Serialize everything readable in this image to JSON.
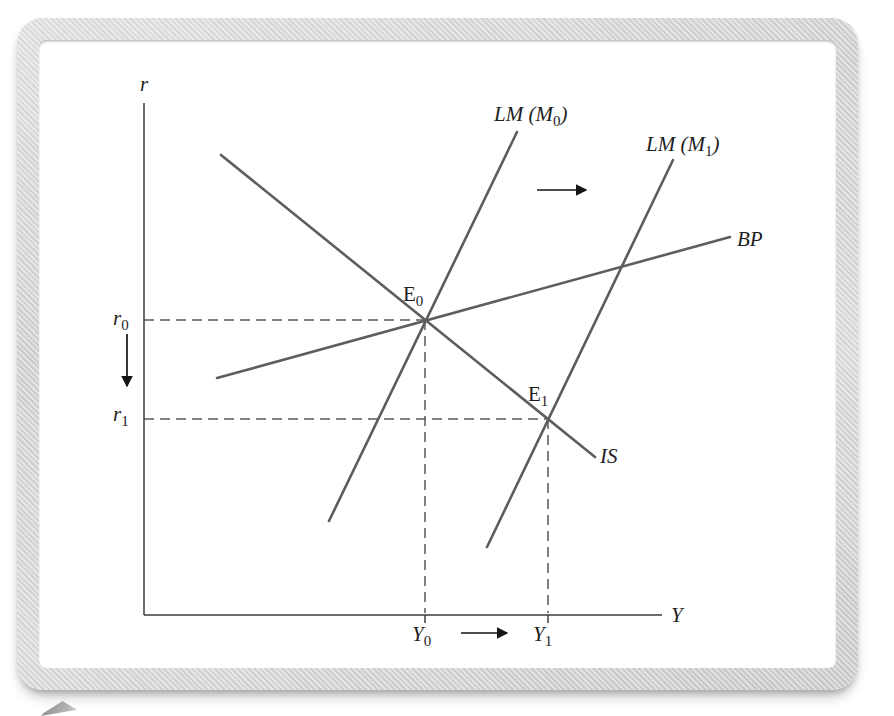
{
  "colors": {
    "curve": "#5d5d5d",
    "axis": "#3c3c3c",
    "guide": "#5a5a5a",
    "arrow": "#151515",
    "text": "#1e1e1e",
    "canvas": "#ffffff"
  },
  "diagram": {
    "axes": [
      {
        "name": "r-axis",
        "x1": 144,
        "y1": 103,
        "x2": 144,
        "y2": 615
      },
      {
        "name": "y-axis",
        "x1": 144,
        "y1": 615,
        "x2": 662,
        "y2": 615
      }
    ],
    "curves": [
      {
        "name": "is-curve",
        "x1": 221,
        "y1": 155,
        "x2": 595,
        "y2": 457
      },
      {
        "name": "lm-m0-curve",
        "x1": 329,
        "y1": 521,
        "x2": 517,
        "y2": 132
      },
      {
        "name": "lm-m1-curve",
        "x1": 487,
        "y1": 547,
        "x2": 673,
        "y2": 160
      },
      {
        "name": "bp-curve",
        "x1": 217,
        "y1": 378,
        "x2": 730,
        "y2": 237
      }
    ],
    "guides": [
      {
        "name": "r0-guide",
        "x1": 144,
        "y1": 320,
        "x2": 425,
        "y2": 320
      },
      {
        "name": "r1-guide",
        "x1": 144,
        "y1": 419,
        "x2": 548,
        "y2": 419
      },
      {
        "name": "y0-guide",
        "x1": 425,
        "y1": 320,
        "x2": 425,
        "y2": 613
      },
      {
        "name": "y1-guide",
        "x1": 548,
        "y1": 419,
        "x2": 548,
        "y2": 613
      }
    ],
    "ticks": [
      {
        "name": "y0-tick",
        "x1": 425,
        "y1": 615,
        "x2": 425,
        "y2": 623
      },
      {
        "name": "y1-tick",
        "x1": 548,
        "y1": 615,
        "x2": 548,
        "y2": 623
      }
    ],
    "arrows": [
      {
        "name": "lm-shift-arrow",
        "x1": 537,
        "y1": 190,
        "x2": 586,
        "y2": 190
      },
      {
        "name": "rate-fall-arrow",
        "x1": 127,
        "y1": 334,
        "x2": 127,
        "y2": 386
      },
      {
        "name": "income-rise-arrow",
        "x1": 461,
        "y1": 633,
        "x2": 507,
        "y2": 633
      }
    ],
    "points": [
      {
        "name": "e0-point",
        "x": 425,
        "y": 320
      },
      {
        "name": "e1-point",
        "x": 548,
        "y": 419
      }
    ],
    "labels": [
      {
        "name": "r-axis-label",
        "x": 140,
        "y": 91,
        "pre": "r",
        "style": "italic"
      },
      {
        "name": "y-axis-label",
        "x": 671,
        "y": 622,
        "pre": "Y",
        "style": "italic"
      },
      {
        "name": "lm-m0-label",
        "x": 494,
        "y": 121,
        "pre": "LM (M",
        "sub": "0",
        "post": ")",
        "style": "italic"
      },
      {
        "name": "lm-m1-label",
        "x": 646,
        "y": 151,
        "pre": "LM (M",
        "sub": "1",
        "post": ")",
        "style": "italic"
      },
      {
        "name": "bp-label",
        "x": 737,
        "y": 246,
        "pre": "BP",
        "style": "italic"
      },
      {
        "name": "is-label",
        "x": 600,
        "y": 463,
        "pre": "IS",
        "style": "italic"
      },
      {
        "name": "e0-label",
        "x": 403,
        "y": 301,
        "pre": "E",
        "sub": "0",
        "style": "normal"
      },
      {
        "name": "e1-label",
        "x": 528,
        "y": 401,
        "pre": "E",
        "sub": "1",
        "style": "normal"
      },
      {
        "name": "r0-label",
        "x": 113,
        "y": 325,
        "pre": "r",
        "sub": "0",
        "style": "italic"
      },
      {
        "name": "r1-label",
        "x": 113,
        "y": 421,
        "pre": "r",
        "sub": "1",
        "style": "italic"
      },
      {
        "name": "y0-label",
        "x": 412,
        "y": 641,
        "pre": "Y",
        "sub": "0",
        "style": "italic"
      },
      {
        "name": "y1-label",
        "x": 533,
        "y": 641,
        "pre": "Y",
        "sub": "1",
        "style": "italic"
      }
    ]
  }
}
